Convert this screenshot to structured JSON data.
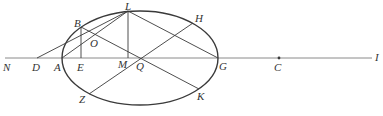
{
  "diagram": {
    "type": "geometry-ellipse",
    "stroke_color": "#3a3a3a",
    "axis_color": "#8a8a8a",
    "ellipse": {
      "cx": 140,
      "cy": 58,
      "rx": 78,
      "ry": 47
    },
    "axis": {
      "x1": 5,
      "y1": 58,
      "x2": 372,
      "y2": 58
    },
    "points": {
      "N": {
        "x": 5,
        "y": 58
      },
      "D": {
        "x": 37,
        "y": 58
      },
      "A": {
        "x": 62,
        "y": 58
      },
      "E": {
        "x": 81,
        "y": 58
      },
      "M": {
        "x": 128,
        "y": 58
      },
      "Q": {
        "x": 140,
        "y": 58
      },
      "G": {
        "x": 218,
        "y": 58
      },
      "C": {
        "x": 279,
        "y": 58
      },
      "I": {
        "x": 372,
        "y": 58
      },
      "B": {
        "x": 81,
        "y": 27
      },
      "L": {
        "x": 128,
        "y": 11
      },
      "H": {
        "x": 193,
        "y": 23
      },
      "Z": {
        "x": 89,
        "y": 94
      },
      "K": {
        "x": 199,
        "y": 89
      },
      "O": {
        "x": 96,
        "y": 42
      }
    },
    "segments": [
      [
        "D",
        "L"
      ],
      [
        "A",
        "L"
      ],
      [
        "L",
        "M"
      ],
      [
        "L",
        "G"
      ],
      [
        "B",
        "E"
      ],
      [
        "B",
        "K"
      ],
      [
        "Z",
        "H"
      ]
    ],
    "labels": [
      {
        "text": "N",
        "x": 3,
        "y": 71
      },
      {
        "text": "D",
        "x": 32,
        "y": 71
      },
      {
        "text": "A",
        "x": 54,
        "y": 71
      },
      {
        "text": "E",
        "x": 77,
        "y": 71
      },
      {
        "text": "M",
        "x": 118,
        "y": 68
      },
      {
        "text": "Q",
        "x": 136,
        "y": 70
      },
      {
        "text": "G",
        "x": 219,
        "y": 70
      },
      {
        "text": "C",
        "x": 274,
        "y": 71
      },
      {
        "text": "I",
        "x": 375,
        "y": 61
      },
      {
        "text": "B",
        "x": 74,
        "y": 27
      },
      {
        "text": "O",
        "x": 90,
        "y": 47
      },
      {
        "text": "L",
        "x": 125,
        "y": 10
      },
      {
        "text": "H",
        "x": 195,
        "y": 22
      },
      {
        "text": "Z",
        "x": 79,
        "y": 103
      },
      {
        "text": "K",
        "x": 197,
        "y": 100
      }
    ]
  }
}
